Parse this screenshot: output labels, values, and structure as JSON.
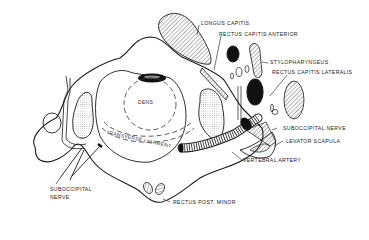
{
  "figure": {
    "colors": {
      "line": "#1a1a1a",
      "fill_black": "#111111",
      "background": "#ffffff",
      "label": "#222222"
    },
    "labels": {
      "longus_capitis": "LONGUS CAPITIS",
      "rectus_capitis_anterior": "RECTUS CAPITIS ANTERIOR",
      "stylopharyngeus": "STYLOPHARYNGEUS",
      "rectus_capitis_lateralis": "RECTUS CAPITIS LATERALIS",
      "dens": "DENS",
      "transverse_ligament": "TRANSVERSE LIGAMENT",
      "suboccipital_nerve_right": "SUBOCCIPITAL NERVE",
      "levator_scapula": "LEVATOR SCAPULA",
      "vertebral_artery": "VERTEBRAL ARTERY",
      "suboccipital_nerve_left_line1": "SUBOCCIPITAL",
      "suboccipital_nerve_left_line2": "NERVE",
      "rectus_post_minor": "RECTUS POST. MINOR"
    }
  }
}
